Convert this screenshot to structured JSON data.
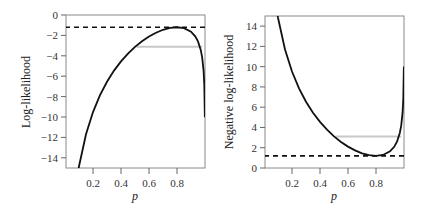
{
  "chart_data": [
    {
      "type": "line",
      "title": "",
      "xlabel": "p",
      "ylabel": "Log-likelihood",
      "xlim": [
        0,
        1
      ],
      "ylim": [
        -15,
        0
      ],
      "xticks": [
        0.2,
        0.4,
        0.6,
        0.8
      ],
      "xtick_labels": [
        "0.2",
        "0.4",
        "0.6",
        "0.8"
      ],
      "yticks": [
        0,
        -2,
        -4,
        -6,
        -8,
        -10,
        -12,
        -14
      ],
      "ytick_labels": [
        "0",
        "−2",
        "−4",
        "−6",
        "−8",
        "−10",
        "−12",
        "−14"
      ],
      "grid": false,
      "legend": null,
      "series": [
        {
          "name": "log-likelihood curve",
          "color": "#111111",
          "style": "solid",
          "x": [
            0.09,
            0.1,
            0.15,
            0.2,
            0.25,
            0.3,
            0.35,
            0.4,
            0.45,
            0.5,
            0.55,
            0.6,
            0.65,
            0.7,
            0.75,
            0.8,
            0.85,
            0.9,
            0.93,
            0.95,
            0.97,
            0.98,
            0.99,
            0.995,
            0.999
          ],
          "y": [
            -15.65,
            -14.83,
            -11.7,
            -9.52,
            -7.86,
            -6.54,
            -5.45,
            -4.55,
            -3.78,
            -3.12,
            -2.57,
            -2.11,
            -1.74,
            -1.45,
            -1.27,
            -1.2,
            -1.29,
            -1.64,
            -2.09,
            -2.59,
            -3.45,
            -4.18,
            -5.48,
            -6.83,
            -10.02
          ]
        },
        {
          "name": "maximum log-likelihood",
          "color": "#111111",
          "style": "dashed",
          "x": [
            0,
            1
          ],
          "y": [
            -1.2,
            -1.2
          ]
        },
        {
          "name": "likelihood interval cutoff",
          "color": "#c8c8c8",
          "style": "solid",
          "x": [
            0.51,
            0.98
          ],
          "y": [
            -3.12,
            -3.12
          ]
        }
      ]
    },
    {
      "type": "line",
      "title": "",
      "xlabel": "p",
      "ylabel": "Negative log-likelihood",
      "xlim": [
        0,
        1
      ],
      "ylim": [
        0,
        15
      ],
      "xticks": [
        0.2,
        0.4,
        0.6,
        0.8
      ],
      "xtick_labels": [
        "0.2",
        "0.4",
        "0.6",
        "0.8"
      ],
      "yticks": [
        0,
        2,
        4,
        6,
        8,
        10,
        12,
        14
      ],
      "ytick_labels": [
        "0",
        "2",
        "4",
        "6",
        "8",
        "10",
        "12",
        "14"
      ],
      "grid": false,
      "legend": null,
      "series": [
        {
          "name": "negative log-likelihood curve",
          "color": "#111111",
          "style": "solid",
          "x": [
            0.09,
            0.1,
            0.15,
            0.2,
            0.25,
            0.3,
            0.35,
            0.4,
            0.45,
            0.5,
            0.55,
            0.6,
            0.65,
            0.7,
            0.75,
            0.8,
            0.85,
            0.9,
            0.93,
            0.95,
            0.97,
            0.98,
            0.99,
            0.995,
            0.999
          ],
          "y": [
            15.65,
            14.83,
            11.7,
            9.52,
            7.86,
            6.54,
            5.45,
            4.55,
            3.78,
            3.12,
            2.57,
            2.11,
            1.74,
            1.45,
            1.27,
            1.2,
            1.29,
            1.64,
            2.09,
            2.59,
            3.45,
            4.18,
            5.48,
            6.83,
            10.02
          ]
        },
        {
          "name": "minimum negative log-likelihood",
          "color": "#111111",
          "style": "dashed",
          "x": [
            0,
            1
          ],
          "y": [
            1.2,
            1.2
          ]
        },
        {
          "name": "likelihood interval cutoff",
          "color": "#c8c8c8",
          "style": "solid",
          "x": [
            0.51,
            0.98
          ],
          "y": [
            3.12,
            3.12
          ]
        }
      ]
    }
  ],
  "panels": [
    {
      "ylabel": "Log-likelihood",
      "xlabel": "p"
    },
    {
      "ylabel": "Negative log-likelihood",
      "xlabel": "p"
    }
  ]
}
